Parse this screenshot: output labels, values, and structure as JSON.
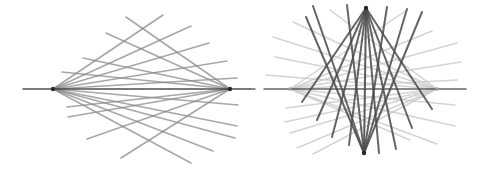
{
  "diagram": {
    "description": "Two line-pencil diagrams: a light two-pivot fan on the left, and on the right the same fan rendered faintly with a dark vertical two-pivot fan overlaid",
    "colors": {
      "background": "#ffffff",
      "left_line": "#8a8a8a",
      "axis_line": "#3c3c3c",
      "right_light_line": "#c8c8c8",
      "right_dark_line": "#4a4a4a",
      "pivot": "#2a2a2a"
    },
    "left_figure": {
      "axis": {
        "x1": 23,
        "y1": 89,
        "x2": 250,
        "y2": 89
      },
      "pivots": [
        {
          "x": 53,
          "y": 89
        },
        {
          "x": 230,
          "y": 89
        }
      ],
      "lines_from_left_pivot": [
        {
          "x": 163,
          "y": 15
        },
        {
          "x": 191,
          "y": 26
        },
        {
          "x": 209,
          "y": 43
        },
        {
          "x": 227,
          "y": 61
        },
        {
          "x": 237,
          "y": 78
        },
        {
          "x": 238,
          "y": 105
        },
        {
          "x": 237,
          "y": 126
        },
        {
          "x": 235,
          "y": 138
        },
        {
          "x": 213,
          "y": 151
        },
        {
          "x": 191,
          "y": 163
        }
      ],
      "lines_from_right_pivot": [
        {
          "x": 126,
          "y": 17
        },
        {
          "x": 106,
          "y": 33
        },
        {
          "x": 83,
          "y": 58
        },
        {
          "x": 62,
          "y": 72
        },
        {
          "x": 67,
          "y": 107
        },
        {
          "x": 68,
          "y": 117
        },
        {
          "x": 87,
          "y": 139
        },
        {
          "x": 121,
          "y": 158
        }
      ]
    },
    "right_figure": {
      "axis": {
        "x1": 264,
        "y1": 89,
        "x2": 466,
        "y2": 89
      },
      "axis_tick": {
        "x1": 250,
        "y1": 89,
        "x2": 255,
        "y2": 89
      },
      "light_pivots": [
        {
          "x": 290,
          "y": 89
        },
        {
          "x": 437,
          "y": 89
        }
      ],
      "light_lines_from_left_pivot": [
        {
          "x": 407,
          "y": 10
        },
        {
          "x": 432,
          "y": 31
        },
        {
          "x": 457,
          "y": 43
        },
        {
          "x": 461,
          "y": 62
        },
        {
          "x": 457,
          "y": 80
        },
        {
          "x": 455,
          "y": 105
        },
        {
          "x": 455,
          "y": 126
        },
        {
          "x": 437,
          "y": 144
        },
        {
          "x": 410,
          "y": 140
        }
      ],
      "light_lines_from_right_pivot": [
        {
          "x": 330,
          "y": 10
        },
        {
          "x": 293,
          "y": 22
        },
        {
          "x": 273,
          "y": 37
        },
        {
          "x": 275,
          "y": 57
        },
        {
          "x": 266,
          "y": 75
        },
        {
          "x": 286,
          "y": 108
        },
        {
          "x": 285,
          "y": 122
        },
        {
          "x": 290,
          "y": 133
        },
        {
          "x": 297,
          "y": 148
        },
        {
          "x": 313,
          "y": 154
        }
      ],
      "dark_pivots": [
        {
          "x": 366,
          "y": 8
        },
        {
          "x": 364,
          "y": 153
        }
      ],
      "dark_lines_from_top_pivot": [
        {
          "x": 302,
          "y": 102
        },
        {
          "x": 317,
          "y": 120
        },
        {
          "x": 332,
          "y": 137
        },
        {
          "x": 349,
          "y": 145
        },
        {
          "x": 379,
          "y": 153
        },
        {
          "x": 396,
          "y": 149
        },
        {
          "x": 412,
          "y": 128
        },
        {
          "x": 432,
          "y": 109
        }
      ],
      "dark_lines_from_bottom_pivot": [
        {
          "x": 306,
          "y": 17
        },
        {
          "x": 313,
          "y": 6
        },
        {
          "x": 347,
          "y": 5
        },
        {
          "x": 387,
          "y": 7
        },
        {
          "x": 407,
          "y": 9
        },
        {
          "x": 422,
          "y": 12
        }
      ],
      "dark_vertical": {
        "x1": 366,
        "y1": 8,
        "x2": 364,
        "y2": 153
      }
    }
  }
}
